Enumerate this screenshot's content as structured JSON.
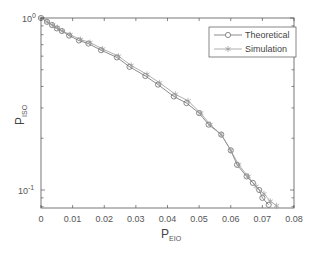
{
  "chart_data": {
    "type": "line",
    "title": "",
    "xlabel": "P_EIO",
    "xlabel_main": "P",
    "xlabel_sub": "EIO",
    "ylabel": "P_ISO",
    "ylabel_main": "P",
    "ylabel_sub": "ISO",
    "xlim": [
      0,
      0.08
    ],
    "ylim": [
      0.079,
      1.0
    ],
    "yscale": "log",
    "grid": false,
    "legend_position": "upper right",
    "x_ticks": [
      "0",
      "0.01",
      "0.02",
      "0.03",
      "0.04",
      "0.05",
      "0.06",
      "0.07",
      "0.08"
    ],
    "y_ticks": [
      "10^0",
      "10^-1"
    ],
    "series": [
      {
        "name": "Theoretical",
        "marker": "circle",
        "color": "#6e6e6e",
        "x": [
          0,
          0.0019,
          0.0035,
          0.005,
          0.0066,
          0.0089,
          0.012,
          0.015,
          0.019,
          0.024,
          0.028,
          0.033,
          0.037,
          0.042,
          0.046,
          0.05,
          0.053,
          0.057,
          0.06,
          0.062,
          0.065,
          0.067,
          0.069,
          0.07,
          0.072
        ],
        "y": [
          1.0,
          0.95,
          0.91,
          0.87,
          0.84,
          0.79,
          0.74,
          0.71,
          0.65,
          0.59,
          0.52,
          0.46,
          0.41,
          0.35,
          0.32,
          0.28,
          0.24,
          0.21,
          0.17,
          0.14,
          0.12,
          0.11,
          0.1,
          0.09,
          0.082
        ]
      },
      {
        "name": "Simulation",
        "marker": "asterisk",
        "color": "#9a9a9a",
        "x": [
          0,
          0.002,
          0.0037,
          0.0052,
          0.0068,
          0.0092,
          0.0125,
          0.0155,
          0.0195,
          0.0245,
          0.0285,
          0.0335,
          0.0375,
          0.0425,
          0.0465,
          0.0505,
          0.0535,
          0.057,
          0.06,
          0.0625,
          0.0655,
          0.068,
          0.0705,
          0.0725,
          0.0745
        ],
        "y": [
          1.0,
          0.95,
          0.91,
          0.88,
          0.84,
          0.8,
          0.75,
          0.72,
          0.66,
          0.6,
          0.53,
          0.47,
          0.42,
          0.36,
          0.33,
          0.28,
          0.24,
          0.21,
          0.17,
          0.14,
          0.12,
          0.105,
          0.095,
          0.086,
          0.081
        ]
      }
    ]
  },
  "legend": {
    "items": [
      {
        "label": "Theoretical"
      },
      {
        "label": "Simulation"
      }
    ]
  },
  "axes": {
    "x_tick_labels": [
      "0",
      "0.01",
      "0.02",
      "0.03",
      "0.04",
      "0.05",
      "0.06",
      "0.07",
      "0.08"
    ],
    "y_tick_main": "10",
    "y_tick_top_exp": "0",
    "y_tick_bottom_exp": "-1",
    "xlabel_main": "P",
    "xlabel_sub": "EIO",
    "ylabel_main": "P",
    "ylabel_sub": "ISO"
  }
}
